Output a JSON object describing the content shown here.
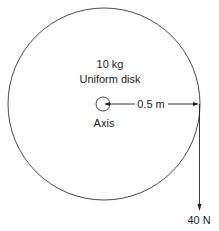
{
  "diagram": {
    "disk_mass_label": "10 kg",
    "disk_type_label": "Uniform disk",
    "axis_label": "Axis",
    "radius_label": "0.5 m",
    "force_label": "40 N"
  },
  "colors": {
    "stroke": "#222222",
    "background": "#ffffff"
  }
}
